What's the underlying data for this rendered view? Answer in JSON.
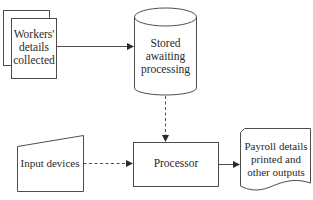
{
  "diagram": {
    "nodes": {
      "workers": {
        "label_lines": [
          "Workers'",
          "details",
          "collected"
        ],
        "shape": "multi-document"
      },
      "stored": {
        "label_lines": [
          "Stored",
          "awaiting",
          "processing"
        ],
        "shape": "cylinder"
      },
      "input": {
        "label": "Input devices",
        "shape": "manual-input"
      },
      "processor": {
        "label": "Processor",
        "shape": "rectangle"
      },
      "output": {
        "label_lines": [
          "Payroll details",
          "printed and",
          "other outputs"
        ],
        "shape": "document"
      }
    },
    "edges": [
      {
        "from": "workers",
        "to": "stored",
        "style": "solid"
      },
      {
        "from": "stored",
        "to": "processor",
        "style": "dashed"
      },
      {
        "from": "input",
        "to": "processor",
        "style": "dashed"
      },
      {
        "from": "processor",
        "to": "output",
        "style": "solid"
      }
    ],
    "colors": {
      "stroke": "#3a3a3a",
      "text": "#2a2a2a",
      "background": "#ffffff"
    }
  }
}
